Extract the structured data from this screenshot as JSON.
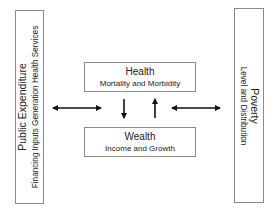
{
  "diagram": {
    "left_box": {
      "title": "Public Expenditure",
      "subtitle": "Financing Inputs Generation Health Services"
    },
    "right_box": {
      "title": "Poverty",
      "subtitle": "Level and Distribution"
    },
    "health_box": {
      "title": "Health",
      "subtitle": "Mortality and Morbidity"
    },
    "wealth_box": {
      "title": "Wealth",
      "subtitle": "Income and Growth"
    },
    "arrows": [
      {
        "from": "Public Expenditure",
        "to": "Health/Wealth",
        "type": "bidirectional"
      },
      {
        "from": "Health",
        "to": "Wealth",
        "type": "down"
      },
      {
        "from": "Wealth",
        "to": "Health",
        "type": "up"
      },
      {
        "from": "Health/Wealth",
        "to": "Poverty",
        "type": "bidirectional"
      }
    ],
    "colors": {
      "border": "#8a8a8a",
      "arrow": "#111111",
      "text": "#222222"
    }
  }
}
